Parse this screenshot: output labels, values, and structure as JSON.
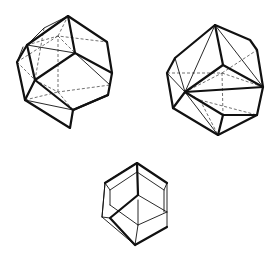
{
  "figure": {
    "colors": {
      "line": "#111111",
      "hidden_line": "#333333",
      "background": "#ffffff"
    },
    "polyhedra": [
      {
        "name": "polyhedron-top-left",
        "position": "top-left"
      },
      {
        "name": "polyhedron-top-right",
        "position": "top-right"
      },
      {
        "name": "polyhedron-bottom-center",
        "position": "bottom-center"
      }
    ]
  }
}
